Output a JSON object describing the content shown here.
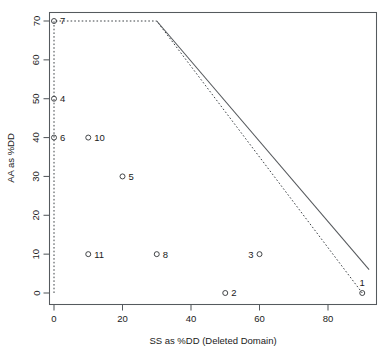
{
  "chart_data": {
    "type": "scatter",
    "title": "",
    "xlabel": "SS as %DD (Deleted Domain)",
    "ylabel": "AA as %DD",
    "xlim": [
      -2.5,
      94.5
    ],
    "ylim": [
      -2.0,
      72.5
    ],
    "xticks": [
      0,
      20,
      40,
      60,
      80
    ],
    "yticks": [
      0,
      10,
      20,
      30,
      40,
      50,
      60,
      70
    ],
    "grid": false,
    "legend": "none",
    "point_label_field": "label",
    "points": [
      {
        "label": "7",
        "x": 0,
        "y": 70,
        "label_side": "right"
      },
      {
        "label": "4",
        "x": 0,
        "y": 50,
        "label_side": "right"
      },
      {
        "label": "6",
        "x": 0,
        "y": 40,
        "label_side": "right"
      },
      {
        "label": "10",
        "x": 10,
        "y": 40,
        "label_side": "right"
      },
      {
        "label": "5",
        "x": 20,
        "y": 30,
        "label_side": "right"
      },
      {
        "label": "11",
        "x": 10,
        "y": 10,
        "label_side": "right"
      },
      {
        "label": "8",
        "x": 30,
        "y": 10,
        "label_side": "right"
      },
      {
        "label": "3",
        "x": 60,
        "y": 10,
        "label_side": "left"
      },
      {
        "label": "2",
        "x": 50,
        "y": 0,
        "label_side": "right"
      },
      {
        "label": "1",
        "x": 90,
        "y": 0,
        "label_side": "above"
      }
    ],
    "annotations": [
      {
        "name": "dashed-feasible-hull",
        "style": "dashed",
        "vertices": [
          {
            "x": 0,
            "y": 0
          },
          {
            "x": 0,
            "y": 70
          },
          {
            "x": 30,
            "y": 70
          },
          {
            "x": 90,
            "y": 0
          }
        ]
      },
      {
        "name": "solid-tradeoff-boundary",
        "style": "solid",
        "vertices": [
          {
            "x": 30,
            "y": 70
          },
          {
            "x": 92,
            "y": 6
          }
        ]
      }
    ]
  }
}
